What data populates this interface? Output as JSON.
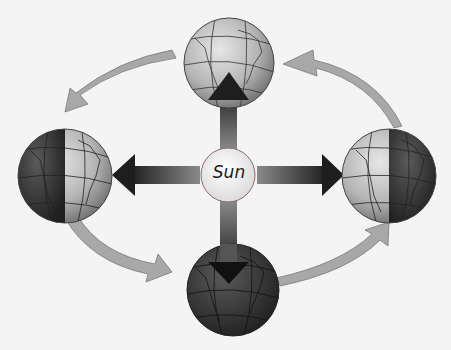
{
  "diagram": {
    "title": "",
    "sun": {
      "label": "Sun"
    },
    "earth_positions": [
      {
        "id": "top",
        "lighting": "lit-near-side"
      },
      {
        "id": "left",
        "lighting": "left-half-dark"
      },
      {
        "id": "bottom",
        "lighting": "near-side-dark"
      },
      {
        "id": "right",
        "lighting": "right-half-dark"
      }
    ],
    "sunlight_arrows": [
      "up",
      "left",
      "right",
      "down"
    ],
    "orbit_direction": "counterclockwise-as-drawn: top -> left -> bottom -> right -> top"
  },
  "colors": {
    "background": "#f4f4f4",
    "orbit_arrow": "#a8a8a8",
    "sunlight_arrow_dark": "#1e1e1e",
    "sunlight_arrow_light": "#8a8a8a",
    "sun_fill": "#f5f5f5",
    "globe_light": "#c9c9c9",
    "globe_dark": "#3a3a3a"
  }
}
